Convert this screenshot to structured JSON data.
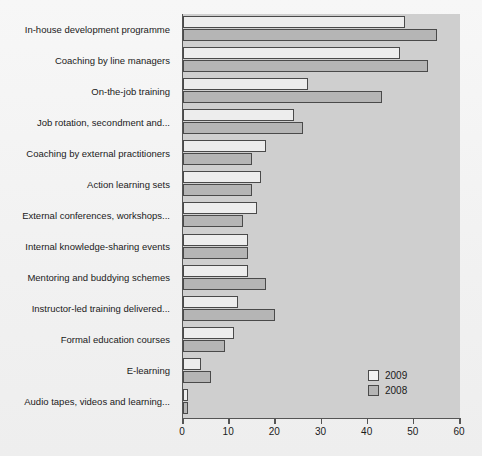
{
  "chart_data": {
    "type": "bar",
    "orientation": "horizontal",
    "title": "",
    "subtitle": "",
    "xlabel": "",
    "ylabel": "",
    "xlim": [
      0,
      60
    ],
    "xticks": [
      0,
      10,
      20,
      30,
      40,
      50,
      60
    ],
    "xtick_labels": [
      "0",
      "10",
      "20",
      "30",
      "40",
      "50",
      "60"
    ],
    "grid": false,
    "legend_position": "bottom-right",
    "categories": [
      "In-house development programme",
      "Coaching by line managers",
      "On-the-job training",
      "Job rotation, secondment and...",
      "Coaching by external practitioners",
      "Action learning sets",
      "External conferences, workshops...",
      "Internal knowledge-sharing events",
      "Mentoring and buddying schemes",
      "Instructor-led training delivered...",
      "Formal education courses",
      "E-learning",
      "Audio tapes, videos and learning..."
    ],
    "series": [
      {
        "name": "2009",
        "color": "#ededed",
        "values": [
          48,
          47,
          27,
          24,
          18,
          17,
          16,
          14,
          14,
          12,
          11,
          4,
          1
        ]
      },
      {
        "name": "2008",
        "color": "#b5b5b5",
        "values": [
          55,
          53,
          43,
          26,
          15,
          15,
          13,
          14,
          18,
          20,
          9,
          6,
          1
        ]
      }
    ]
  },
  "legend": {
    "items": [
      {
        "label": "2009",
        "swatch_class": "y2009"
      },
      {
        "label": "2008",
        "swatch_class": "y2008"
      }
    ]
  },
  "colors": {
    "page_background": "#f2f2f2",
    "plot_background": "#cfcfcf",
    "axis": "#555555",
    "bar_outline": "#4a4a4a",
    "series_2009": "#ededed",
    "series_2008": "#b5b5b5",
    "text": "#1a1a1a"
  }
}
